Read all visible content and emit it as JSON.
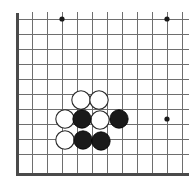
{
  "figure": {
    "board_label": "go-board",
    "width": 189,
    "height": 187
  },
  "board": {
    "origin_x": 17,
    "origin_y": 174,
    "spacing": 15,
    "colors": {
      "background": "#ffffff",
      "grid": "#6e6e6e",
      "grid_faint": "#9a9a9a",
      "edge": "#4a4a4a",
      "black_stone": "#1a1a1a",
      "white_stone": "#ffffff",
      "white_stone_outline": "#2a2a2a",
      "star_point": "#1a1a1a"
    },
    "vertical_lines_x": [
      17,
      32,
      47,
      62,
      77,
      92,
      107,
      122,
      137,
      152,
      167,
      182
    ],
    "horizontal_lines_y": [
      19,
      34,
      49,
      64,
      79,
      94,
      109,
      124,
      139,
      154,
      174
    ],
    "edges": [
      {
        "name": "left-edge",
        "x1": 17,
        "y1": 12,
        "x2": 17,
        "y2": 175
      },
      {
        "name": "bottom-edge",
        "x1": 16,
        "y1": 174,
        "x2": 189,
        "y2": 174
      }
    ],
    "star_points": [
      {
        "name": "star-point-upper-left",
        "x": 62,
        "y": 19,
        "r": 2.6
      },
      {
        "name": "star-point-upper-right",
        "x": 167,
        "y": 19,
        "r": 2.6
      },
      {
        "name": "star-point-right",
        "x": 167,
        "y": 119,
        "r": 2.6
      }
    ],
    "stone_radius": 9.2
  },
  "stones": [
    {
      "id": "w1",
      "color": "white",
      "x": 81,
      "y": 100,
      "label": "white-stone"
    },
    {
      "id": "w2",
      "color": "white",
      "x": 99,
      "y": 100,
      "label": "white-stone"
    },
    {
      "id": "w3",
      "color": "white",
      "x": 65,
      "y": 119,
      "label": "white-stone"
    },
    {
      "id": "w4",
      "color": "white",
      "x": 100,
      "y": 120,
      "label": "white-stone"
    },
    {
      "id": "w5",
      "color": "white",
      "x": 65,
      "y": 140,
      "label": "white-stone"
    },
    {
      "id": "b1",
      "color": "black",
      "x": 82,
      "y": 119,
      "label": "black-stone"
    },
    {
      "id": "b2",
      "color": "black",
      "x": 119,
      "y": 119,
      "label": "black-stone"
    },
    {
      "id": "b3",
      "color": "black",
      "x": 83,
      "y": 140,
      "label": "black-stone"
    },
    {
      "id": "b4",
      "color": "black",
      "x": 101,
      "y": 141,
      "label": "black-stone"
    }
  ],
  "counts": {
    "black_stones": 4,
    "white_stones": 5,
    "total_stones": 9
  }
}
